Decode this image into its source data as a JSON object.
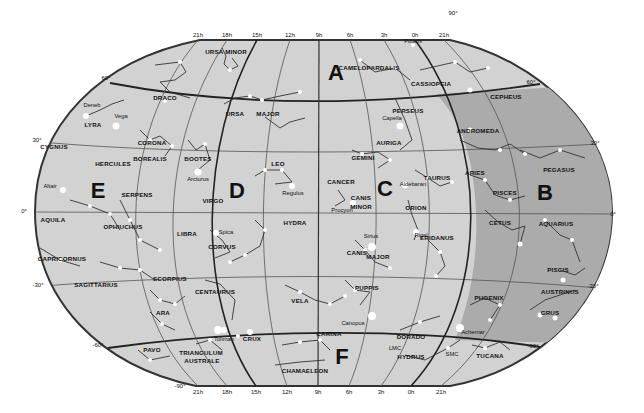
{
  "colors": {
    "background": "#ffffff",
    "sky_light": "#d2d2d2",
    "sky_zone_b": "#ababab",
    "grid": "#555555",
    "border": "#333333",
    "stars": "#ffffff",
    "text": "#111111"
  },
  "zones": [
    {
      "id": "A",
      "x": 336,
      "y": 72
    },
    {
      "id": "B",
      "x": 545,
      "y": 192
    },
    {
      "id": "C",
      "x": 385,
      "y": 188
    },
    {
      "id": "D",
      "x": 237,
      "y": 190
    },
    {
      "id": "E",
      "x": 98,
      "y": 190
    },
    {
      "id": "F",
      "x": 342,
      "y": 356
    }
  ],
  "top_hour_ticks": [
    {
      "label": "21h",
      "x": 198
    },
    {
      "label": "18h",
      "x": 227
    },
    {
      "label": "15h",
      "x": 257
    },
    {
      "label": "12h",
      "x": 290
    },
    {
      "label": "9h",
      "x": 319
    },
    {
      "label": "6h",
      "x": 350
    },
    {
      "label": "3h",
      "x": 384
    },
    {
      "label": "0h",
      "x": 415
    },
    {
      "label": "21h",
      "x": 444
    }
  ],
  "bottom_hour_ticks": [
    {
      "label": "21h",
      "x": 198
    },
    {
      "label": "18h",
      "x": 227
    },
    {
      "label": "15h",
      "x": 256
    },
    {
      "label": "12h",
      "x": 287
    },
    {
      "label": "9h",
      "x": 318
    },
    {
      "label": "6h",
      "x": 349
    },
    {
      "label": "3h",
      "x": 381
    },
    {
      "label": "0h",
      "x": 411
    },
    {
      "label": "21h",
      "x": 441
    }
  ],
  "declination_ticks": [
    {
      "label": "90°",
      "x": 453,
      "y": 15
    },
    {
      "label": "60°",
      "x": 106,
      "y": 80
    },
    {
      "label": "60°",
      "x": 531,
      "y": 84
    },
    {
      "label": "30°",
      "x": 37,
      "y": 142
    },
    {
      "label": "30°",
      "x": 595,
      "y": 145
    },
    {
      "label": "0°",
      "x": 24,
      "y": 213
    },
    {
      "label": "0°",
      "x": 613,
      "y": 216
    },
    {
      "label": "-30°",
      "x": 38,
      "y": 287
    },
    {
      "label": "-30°",
      "x": 593,
      "y": 288
    },
    {
      "label": "-60°",
      "x": 98,
      "y": 347
    },
    {
      "label": "-60°",
      "x": 533,
      "y": 348
    },
    {
      "label": "-90°",
      "x": 180,
      "y": 388
    }
  ],
  "constellations": [
    {
      "name": "URSA MINOR",
      "x": 226,
      "y": 54
    },
    {
      "name": "CAMELOPARDALIS",
      "x": 369,
      "y": 70
    },
    {
      "name": "CASSIOPEIA",
      "x": 431,
      "y": 86
    },
    {
      "name": "CEPHEUS",
      "x": 506,
      "y": 99
    },
    {
      "name": "DRACO",
      "x": 165,
      "y": 100
    },
    {
      "name": "URSA",
      "x": 235,
      "y": 116
    },
    {
      "name": "MAJOR",
      "x": 268,
      "y": 116
    },
    {
      "name": "PERSEUS",
      "x": 408,
      "y": 113
    },
    {
      "name": "LYRA",
      "x": 93,
      "y": 127
    },
    {
      "name": "AURIGA",
      "x": 389,
      "y": 145
    },
    {
      "name": "ANDROMEDA",
      "x": 478,
      "y": 133
    },
    {
      "name": "CYGNUS",
      "x": 54,
      "y": 149
    },
    {
      "name": "CORONA",
      "x": 152,
      "y": 145
    },
    {
      "name": "BOREALIS",
      "x": 150,
      "y": 161
    },
    {
      "name": "HERCULES",
      "x": 113,
      "y": 166
    },
    {
      "name": "BOOTES",
      "x": 198,
      "y": 161
    },
    {
      "name": "GEMINI",
      "x": 363,
      "y": 160
    },
    {
      "name": "LEO",
      "x": 278,
      "y": 166
    },
    {
      "name": "PEGASUS",
      "x": 559,
      "y": 172
    },
    {
      "name": "TAURUS",
      "x": 437,
      "y": 180
    },
    {
      "name": "ARIES",
      "x": 475,
      "y": 175
    },
    {
      "name": "CANCER",
      "x": 341,
      "y": 184
    },
    {
      "name": "SERPENS",
      "x": 137,
      "y": 197
    },
    {
      "name": "PISCES",
      "x": 505,
      "y": 195
    },
    {
      "name": "CANIS",
      "x": 361,
      "y": 200
    },
    {
      "name": "MINOR",
      "x": 361,
      "y": 209
    },
    {
      "name": "VIRGO",
      "x": 213,
      "y": 203
    },
    {
      "name": "ORION",
      "x": 416,
      "y": 210
    },
    {
      "name": "AQUILA",
      "x": 53,
      "y": 222
    },
    {
      "name": "HYDRA",
      "x": 295,
      "y": 225
    },
    {
      "name": "CETUS",
      "x": 500,
      "y": 225
    },
    {
      "name": "AQUARIUS",
      "x": 556,
      "y": 226
    },
    {
      "name": "OPHIUCHUS",
      "x": 123,
      "y": 229
    },
    {
      "name": "LIBRA",
      "x": 187,
      "y": 236
    },
    {
      "name": "ERIDANUS",
      "x": 437,
      "y": 240
    },
    {
      "name": "CORVUS",
      "x": 222,
      "y": 249
    },
    {
      "name": "CANIS",
      "x": 357,
      "y": 255
    },
    {
      "name": "MAJOR",
      "x": 378,
      "y": 259
    },
    {
      "name": "CAPRICORNUS",
      "x": 62,
      "y": 261
    },
    {
      "name": "SAGITTARIUS",
      "x": 96,
      "y": 287
    },
    {
      "name": "PUPPIS",
      "x": 367,
      "y": 290
    },
    {
      "name": "PISCIS",
      "x": 558,
      "y": 272
    },
    {
      "name": "SCORPIUS",
      "x": 170,
      "y": 281
    },
    {
      "name": "AUSTRINUS",
      "x": 560,
      "y": 294
    },
    {
      "name": "CENTAURUS",
      "x": 215,
      "y": 294
    },
    {
      "name": "PHOENIX",
      "x": 489,
      "y": 300
    },
    {
      "name": "VELA",
      "x": 300,
      "y": 303
    },
    {
      "name": "GRUS",
      "x": 550,
      "y": 315
    },
    {
      "name": "ARA",
      "x": 163,
      "y": 315
    },
    {
      "name": "CARINA",
      "x": 329,
      "y": 336
    },
    {
      "name": "CRUX",
      "x": 252,
      "y": 341
    },
    {
      "name": "DORADO",
      "x": 411,
      "y": 339
    },
    {
      "name": "PAVO",
      "x": 152,
      "y": 352
    },
    {
      "name": "TRIANGULUM",
      "x": 201,
      "y": 355
    },
    {
      "name": "AUSTRALE",
      "x": 202,
      "y": 363
    },
    {
      "name": "HYDRUS",
      "x": 411,
      "y": 359
    },
    {
      "name": "TUCANA",
      "x": 490,
      "y": 358
    },
    {
      "name": "CHAMAELEON",
      "x": 305,
      "y": 373
    }
  ],
  "stars": [
    {
      "name": "Polaris",
      "x": 413,
      "y": 43
    },
    {
      "name": "Deneb",
      "x": 92,
      "y": 107
    },
    {
      "name": "Vega",
      "x": 121,
      "y": 118
    },
    {
      "name": "Capella",
      "x": 392,
      "y": 120
    },
    {
      "name": "Arcturus",
      "x": 198,
      "y": 181
    },
    {
      "name": "Regulus",
      "x": 293,
      "y": 195
    },
    {
      "name": "Aldebaran",
      "x": 413,
      "y": 186
    },
    {
      "name": "Altair",
      "x": 50,
      "y": 188
    },
    {
      "name": "Procyon",
      "x": 342,
      "y": 212
    },
    {
      "name": "Spica",
      "x": 226,
      "y": 234
    },
    {
      "name": "Rigel",
      "x": 421,
      "y": 237
    },
    {
      "name": "Sirius",
      "x": 371,
      "y": 238
    },
    {
      "name": "Canopus",
      "x": 353,
      "y": 325
    },
    {
      "name": "Achernar",
      "x": 473,
      "y": 334
    },
    {
      "name": "Toliman",
      "x": 224,
      "y": 341
    },
    {
      "name": "LMC",
      "x": 395,
      "y": 350
    },
    {
      "name": "SMC",
      "x": 452,
      "y": 356
    }
  ]
}
